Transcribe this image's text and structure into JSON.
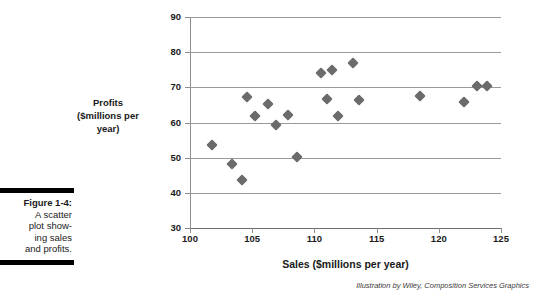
{
  "caption": {
    "label": "Figure 1-4:",
    "lines": [
      "A scatter",
      "plot show-",
      "ing sales",
      "and profits."
    ]
  },
  "credit": "Illustration by Wiley, Composition Services Graphics",
  "axis_titles": {
    "y_line1": "Profits",
    "y_line2": "($millions per",
    "y_line3": "year)",
    "x": "Sales ($millions per year)"
  },
  "colors": {
    "marker": "#6b6b6b",
    "gridline": "#9a9a9a",
    "axis": "#8d8d8d",
    "text": "#1a1a1a",
    "rule": "#000000"
  },
  "chart_data": {
    "type": "scatter",
    "title": "",
    "xlabel": "Sales ($millions per year)",
    "ylabel": "Profits ($millions per year)",
    "xlim": [
      100,
      125
    ],
    "ylim": [
      30,
      90
    ],
    "xticks": [
      100,
      105,
      110,
      115,
      120,
      125
    ],
    "yticks": [
      30,
      40,
      50,
      60,
      70,
      80,
      90
    ],
    "grid": "horizontal",
    "legend": "none",
    "series": [
      {
        "name": "Sales vs Profits",
        "marker": "diamond",
        "points": [
          [
            101.8,
            53.5
          ],
          [
            103.4,
            48.2
          ],
          [
            104.2,
            43.6
          ],
          [
            104.6,
            67.3
          ],
          [
            105.2,
            61.8
          ],
          [
            106.3,
            65.3
          ],
          [
            106.9,
            59.2
          ],
          [
            107.9,
            62.2
          ],
          [
            108.6,
            50.3
          ],
          [
            110.5,
            74.0
          ],
          [
            111.0,
            66.7
          ],
          [
            111.4,
            75.0
          ],
          [
            111.9,
            61.8
          ],
          [
            113.1,
            77.0
          ],
          [
            113.6,
            66.5
          ],
          [
            118.5,
            67.5
          ],
          [
            122.0,
            65.8
          ],
          [
            123.1,
            70.3
          ],
          [
            123.9,
            70.4
          ]
        ]
      }
    ]
  }
}
